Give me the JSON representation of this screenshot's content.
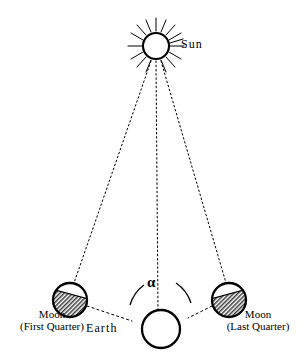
{
  "figure": {
    "type": "astronomy-diagram",
    "background_color": "#ffffff",
    "stroke_color": "#000000"
  },
  "sun": {
    "label": "Sun",
    "center": [
      156,
      46
    ],
    "radius": 13,
    "ray_count": 16,
    "fill": "#ffffff"
  },
  "earth": {
    "label": "Earth",
    "center": [
      161,
      329
    ],
    "radius": 19,
    "fill": "#ffffff"
  },
  "angle": {
    "symbol": "α",
    "name": "alpha",
    "vertex": "earth",
    "arc_label_position": [
      147,
      275
    ]
  },
  "moon_left": {
    "label_line1": "Moon",
    "label_line2": "(First  Quarter)",
    "phase": "First Quarter",
    "center": [
      70,
      300
    ],
    "radius": 17,
    "shaded_side": "lower-left",
    "shading": "hatched"
  },
  "moon_right": {
    "label_line1": "Moon",
    "label_line2": "(Last  Quarter)",
    "phase": "Last Quarter",
    "center": [
      229,
      300
    ],
    "radius": 17,
    "shaded_side": "lower-right",
    "shading": "hatched"
  },
  "rays": [
    {
      "name": "sun-to-moon-left",
      "from": "sun",
      "to": "moon_left",
      "style": "dotted"
    },
    {
      "name": "sun-to-earth",
      "from": "sun",
      "to": "earth",
      "style": "dotted"
    },
    {
      "name": "sun-to-moon-right",
      "from": "sun",
      "to": "moon_right",
      "style": "dotted"
    }
  ],
  "connectors": [
    {
      "name": "moon-left-to-earth",
      "from": "moon_left",
      "to": "earth",
      "style": "dashed"
    },
    {
      "name": "moon-right-to-earth",
      "from": "moon_right",
      "to": "earth",
      "style": "dashed"
    }
  ]
}
